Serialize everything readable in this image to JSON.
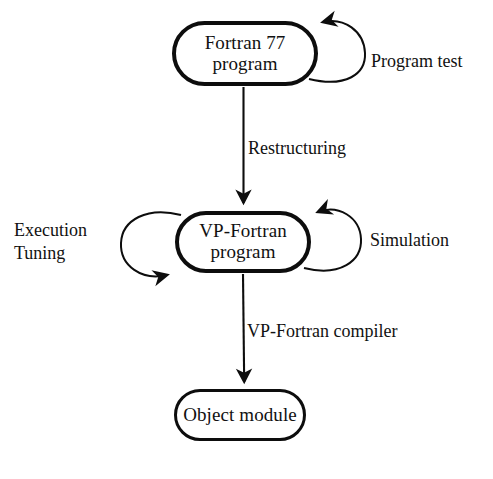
{
  "diagram": {
    "background_color": "#ffffff",
    "stroke_color": "#0d0d0d",
    "nodes": [
      {
        "id": "fortran77",
        "line1": "Fortran 77",
        "line2": "program",
        "shape": "stadium"
      },
      {
        "id": "vpfortran",
        "line1": "VP-Fortran",
        "line2": "program",
        "shape": "stadium"
      },
      {
        "id": "object",
        "line1": "Object module",
        "shape": "stadium"
      }
    ],
    "edges": [
      {
        "id": "restructuring",
        "label": "Restructuring",
        "from": "fortran77",
        "to": "vpfortran",
        "type": "arrow-down"
      },
      {
        "id": "vp-fortran-compiler",
        "label": "VP-Fortran compiler",
        "from": "vpfortran",
        "to": "object",
        "type": "arrow-down"
      }
    ],
    "self_loops": [
      {
        "id": "program-test",
        "label": "Program test",
        "on": "fortran77",
        "side": "right",
        "arrow_position": "top-left"
      },
      {
        "id": "simulation",
        "label": "Simulation",
        "on": "vpfortran",
        "side": "right",
        "arrow_position": "top-left"
      },
      {
        "id": "execution-tuning",
        "label_line1": "Execution",
        "label_line2": "Tuning",
        "on": "vpfortran",
        "side": "left",
        "arrow_position": "bottom-right"
      }
    ]
  }
}
